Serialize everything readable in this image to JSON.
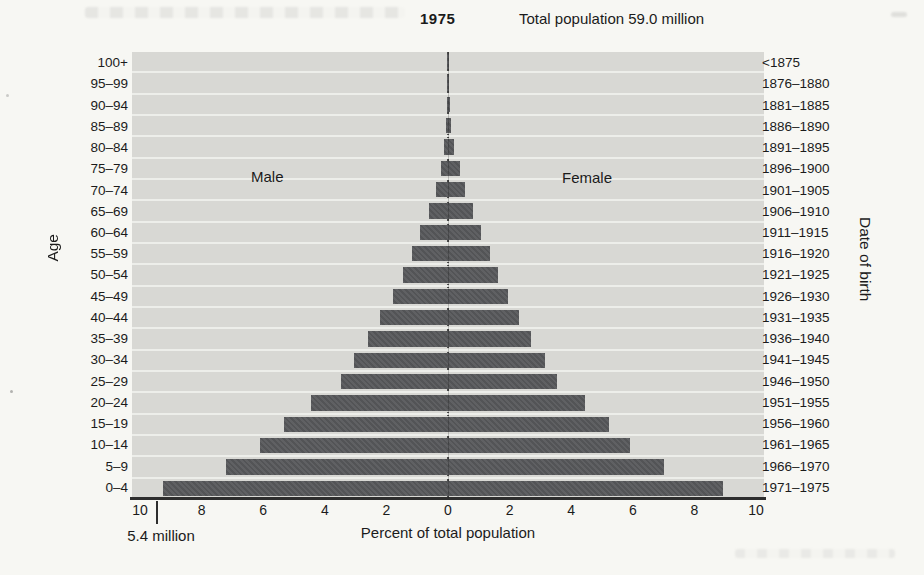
{
  "title": {
    "year": "1975",
    "total": "Total population 59.0 million"
  },
  "side_labels": {
    "male": "Male",
    "female": "Female"
  },
  "axis": {
    "left_label": "Age",
    "right_label": "Date of birth",
    "x_label": "Percent of total population"
  },
  "annotation": {
    "text": "5.4 million",
    "marks_percent_on_male_side": 9.4
  },
  "chart_data": {
    "type": "bar",
    "subtype": "population-pyramid",
    "title": "1975",
    "subtitle": "Total population 59.0 million",
    "xlabel": "Percent of total population",
    "ylabel_left": "Age",
    "ylabel_right": "Date of birth",
    "units": "percent of total population",
    "xlim_each_side": [
      0,
      10.26
    ],
    "x_tick_labels": [
      "10",
      "8",
      "6",
      "4",
      "2",
      "0",
      "2",
      "4",
      "6",
      "8",
      "10"
    ],
    "x_tick_positions": [
      -10,
      -8,
      -6,
      -4,
      -2,
      0,
      2,
      4,
      6,
      8,
      10
    ],
    "grid": "horizontal-row-separators",
    "categories_age": [
      "100+",
      "95–99",
      "90–94",
      "85–89",
      "80–84",
      "75–79",
      "70–74",
      "65–69",
      "60–64",
      "55–59",
      "50–54",
      "45–49",
      "40–44",
      "35–39",
      "30–34",
      "25–29",
      "20–24",
      "15–19",
      "10–14",
      "5–9",
      "0–4"
    ],
    "categories_birth": [
      "<1875",
      "1876–1880",
      "1881–1885",
      "1886–1890",
      "1891–1895",
      "1896–1900",
      "1901–1905",
      "1906–1910",
      "1911–1915",
      "1916–1920",
      "1921–1925",
      "1926–1930",
      "1931–1935",
      "1936–1940",
      "1941–1945",
      "1946–1950",
      "1951–1955",
      "1956–1960",
      "1961–1965",
      "1966–1970",
      "1971–1975"
    ],
    "series": [
      {
        "name": "Male",
        "side": "left",
        "values": [
          0.01,
          0.02,
          0.04,
          0.07,
          0.13,
          0.24,
          0.4,
          0.63,
          0.9,
          1.18,
          1.46,
          1.78,
          2.21,
          2.6,
          3.04,
          3.48,
          4.44,
          5.32,
          6.1,
          7.2,
          9.25
        ]
      },
      {
        "name": "Female",
        "side": "right",
        "values": [
          0.02,
          0.03,
          0.06,
          0.1,
          0.18,
          0.4,
          0.55,
          0.82,
          1.07,
          1.36,
          1.62,
          1.95,
          2.3,
          2.68,
          3.14,
          3.55,
          4.46,
          5.23,
          5.92,
          7.0,
          8.92
        ]
      }
    ],
    "annotation": {
      "text": "5.4 million",
      "refers_to": "0–4 male bar",
      "x_percent": 9.4
    },
    "colors": {
      "bar": "#57585b",
      "plot_bg": "#d8d8d4",
      "gridline": "#edeeea",
      "axis_line": "#2e2e2e",
      "text": "#1b1b1b"
    }
  }
}
